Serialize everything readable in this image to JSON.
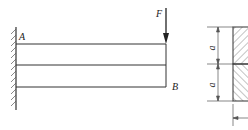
{
  "diagram": {
    "type": "cantilever-beam",
    "labels": {
      "fixed_end": "A",
      "free_end": "B",
      "force": "F",
      "dim_top": "a",
      "dim_bottom": "a"
    },
    "beam_layers": 2,
    "cross_section": {
      "parts": 2,
      "top_hatch": "forward-diagonal",
      "bottom_hatch": "back-diagonal"
    },
    "colors": {
      "line": "#333333",
      "background": "#ffffff"
    }
  }
}
